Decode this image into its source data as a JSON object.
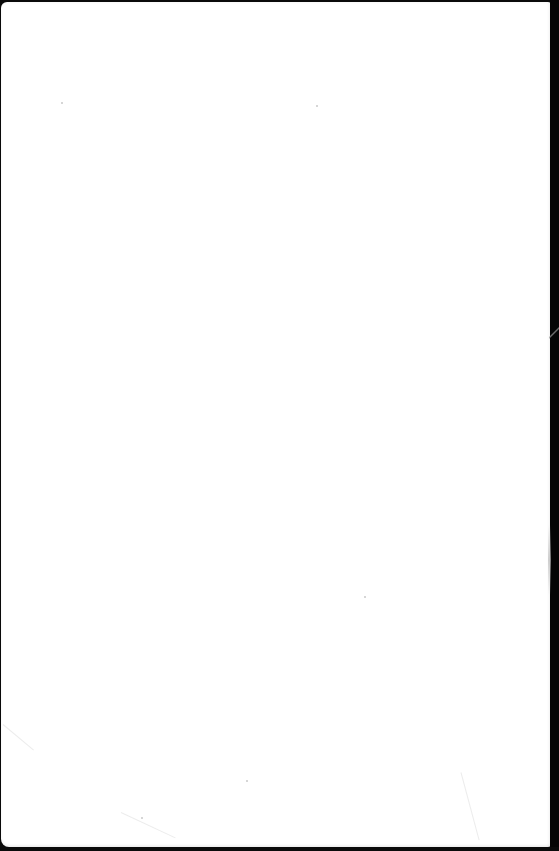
{
  "document": {
    "type": "blank paper sheet",
    "content": "",
    "colors": {
      "paper": "#ffffff",
      "background": "#0a0a0a",
      "speck": "#c8c8c8"
    }
  }
}
